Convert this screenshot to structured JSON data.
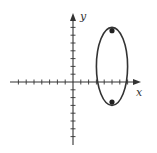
{
  "chart_data": {
    "type": "scatter",
    "title": "",
    "xlabel": "x",
    "ylabel": "y",
    "xlim": [
      -8,
      8
    ],
    "ylim": [
      -8,
      8
    ],
    "grid": false,
    "tick_spacing": 1,
    "tick_labels": false,
    "shapes": [
      {
        "type": "ellipse",
        "center": [
          5,
          2
        ],
        "semi_axis_x": 2,
        "semi_axis_y": 5,
        "orientation": "vertical"
      }
    ],
    "points": [
      {
        "x": 5,
        "y": 6.58,
        "label": "focus"
      },
      {
        "x": 5,
        "y": -2.58,
        "label": "focus"
      }
    ]
  },
  "axes": {
    "x_label": "x",
    "y_label": "y"
  },
  "colors": {
    "stroke": "#333333",
    "background": "#ffffff"
  }
}
